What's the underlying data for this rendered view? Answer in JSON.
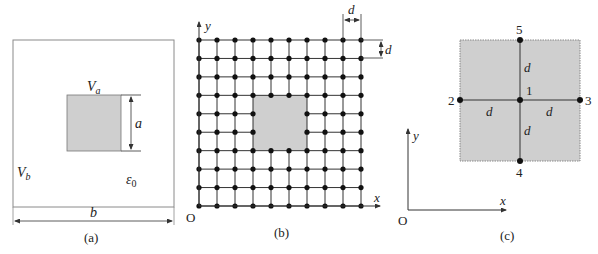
{
  "figure": {
    "colors": {
      "line": "#333333",
      "box": "#8a8a8a",
      "shade": "#cfcfcf",
      "shade_border": "#8a8a8a",
      "node": "#111111",
      "text": "#222222"
    },
    "panel_a": {
      "caption": "(a)",
      "inner_potential": "V",
      "inner_potential_sub": "a",
      "outer_potential": "V",
      "outer_potential_sub": "b",
      "inner_size_label": "a",
      "outer_size_label": "b",
      "permittivity": "ε",
      "permittivity_sub": "0"
    },
    "panel_b": {
      "caption": "(b)",
      "x_axis_label": "x",
      "y_axis_label": "y",
      "origin_label": "O",
      "spacing_label_h": "d",
      "spacing_label_v": "d",
      "grid_columns": 10,
      "grid_rows": 10,
      "shaded_cols": [
        3,
        6
      ],
      "shaded_rows": [
        3,
        6
      ]
    },
    "panel_c": {
      "caption": "(c)",
      "x_axis_label": "x",
      "y_axis_label": "y",
      "origin_label": "O",
      "nodes": [
        {
          "id": "1",
          "position": "center"
        },
        {
          "id": "2",
          "position": "left"
        },
        {
          "id": "3",
          "position": "right"
        },
        {
          "id": "4",
          "position": "bottom"
        },
        {
          "id": "5",
          "position": "top"
        }
      ],
      "arm_labels": [
        "d",
        "d",
        "d",
        "d"
      ]
    }
  }
}
